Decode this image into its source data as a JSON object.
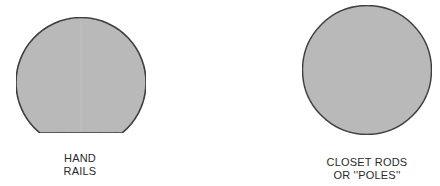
{
  "figures": [
    {
      "id": "hand-rails",
      "shape": "circle-with-flat-bottom",
      "label_lines": [
        "HAND",
        "RAILS"
      ]
    },
    {
      "id": "closet-rods",
      "shape": "circle",
      "label_lines": [
        "CLOSET RODS",
        "OR ''POLES''"
      ]
    }
  ],
  "colors": {
    "fill": "#b9b9b9",
    "stroke": "#2b2b2b",
    "background": "#ffffff",
    "text": "#2a2a2a"
  }
}
